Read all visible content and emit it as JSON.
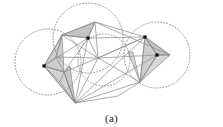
{
  "figure": {
    "caption": "(a)",
    "title": "",
    "background_color": "#ffffff"
  },
  "chart_data": {
    "type": "scatter",
    "title": "",
    "subtitle": "",
    "xlabel": "",
    "ylabel": "",
    "xlim": [
      0,
      223
    ],
    "ylim": [
      0,
      127
    ],
    "grid": false,
    "legend": null,
    "annotations": [
      "(a)"
    ],
    "styles": {
      "edge_color": "#8a8a8a",
      "edge_width": 0.7,
      "dotted_circle_color": "#777777",
      "dotted_circle_width": 0.8,
      "dotted_dash": "1,2",
      "vertex_color": "#111111",
      "vertex_size": 3.2,
      "shaded_face_fill": "#b8b8b8",
      "shaded_face_opacity": 0.75,
      "shaded_face_fill_light": "#cfcfcf"
    },
    "marked_vertices": [
      {
        "id": "v-left",
        "x": 44,
        "y": 66
      },
      {
        "id": "v-top",
        "x": 88,
        "y": 38
      },
      {
        "id": "v-right",
        "x": 157,
        "y": 55
      },
      {
        "id": "v-apex",
        "x": 145,
        "y": 37
      }
    ],
    "nodes": [
      {
        "id": "A",
        "x": 44,
        "y": 66
      },
      {
        "id": "B",
        "x": 62,
        "y": 35
      },
      {
        "id": "C",
        "x": 95,
        "y": 22
      },
      {
        "id": "D",
        "x": 88,
        "y": 38
      },
      {
        "id": "E",
        "x": 145,
        "y": 37
      },
      {
        "id": "F",
        "x": 157,
        "y": 55
      },
      {
        "id": "G",
        "x": 170,
        "y": 55
      },
      {
        "id": "H",
        "x": 140,
        "y": 82
      },
      {
        "id": "I",
        "x": 75,
        "y": 103
      },
      {
        "id": "J",
        "x": 56,
        "y": 57
      },
      {
        "id": "K",
        "x": 64,
        "y": 72
      },
      {
        "id": "L",
        "x": 98,
        "y": 58
      },
      {
        "id": "M",
        "x": 118,
        "y": 96
      },
      {
        "id": "N",
        "x": 60,
        "y": 82
      }
    ],
    "edges": [
      [
        "A",
        "B"
      ],
      [
        "B",
        "C"
      ],
      [
        "C",
        "E"
      ],
      [
        "E",
        "G"
      ],
      [
        "G",
        "F"
      ],
      [
        "E",
        "F"
      ],
      [
        "F",
        "H"
      ],
      [
        "E",
        "H"
      ],
      [
        "H",
        "I"
      ],
      [
        "I",
        "A"
      ],
      [
        "A",
        "D"
      ],
      [
        "B",
        "D"
      ],
      [
        "C",
        "D"
      ],
      [
        "D",
        "E"
      ],
      [
        "D",
        "I"
      ],
      [
        "D",
        "L"
      ],
      [
        "L",
        "E"
      ],
      [
        "L",
        "I"
      ],
      [
        "A",
        "J"
      ],
      [
        "J",
        "K"
      ],
      [
        "K",
        "I"
      ],
      [
        "J",
        "B"
      ],
      [
        "K",
        "D"
      ],
      [
        "A",
        "K"
      ],
      [
        "B",
        "J"
      ],
      [
        "C",
        "L"
      ],
      [
        "I",
        "M"
      ],
      [
        "M",
        "H"
      ],
      [
        "E",
        "I"
      ],
      [
        "F",
        "I"
      ],
      [
        "E",
        "L"
      ],
      [
        "H",
        "L"
      ],
      [
        "A",
        "N"
      ],
      [
        "N",
        "I"
      ],
      [
        "N",
        "K"
      ],
      [
        "J",
        "L"
      ],
      [
        "K",
        "L"
      ],
      [
        "C",
        "G"
      ],
      [
        "B",
        "L"
      ],
      [
        "F",
        "L"
      ]
    ],
    "shaded_faces": [
      {
        "id": "face-top",
        "points": [
          [
            62,
            35
          ],
          [
            95,
            22
          ],
          [
            88,
            38
          ]
        ],
        "fill": "#b0b0b0"
      },
      {
        "id": "face-left-upper",
        "points": [
          [
            44,
            66
          ],
          [
            62,
            35
          ],
          [
            64,
            72
          ]
        ],
        "fill": "#bdbdbd"
      },
      {
        "id": "face-left-lower",
        "points": [
          [
            44,
            66
          ],
          [
            64,
            72
          ],
          [
            75,
            103
          ]
        ],
        "fill": "#c4c4c4"
      },
      {
        "id": "face-left-sliver",
        "points": [
          [
            64,
            72
          ],
          [
            70,
            66
          ],
          [
            75,
            103
          ]
        ],
        "fill": "#b5b5b5"
      },
      {
        "id": "face-right-upper",
        "points": [
          [
            145,
            37
          ],
          [
            170,
            55
          ],
          [
            157,
            55
          ]
        ],
        "fill": "#b0b0b0"
      },
      {
        "id": "face-right-lower",
        "points": [
          [
            145,
            37
          ],
          [
            157,
            55
          ],
          [
            140,
            82
          ]
        ],
        "fill": "#bcbcbc"
      },
      {
        "id": "face-right-tip",
        "points": [
          [
            157,
            55
          ],
          [
            170,
            55
          ],
          [
            140,
            82
          ]
        ],
        "fill": "#c9c9c9"
      },
      {
        "id": "face-bottom-sliver",
        "points": [
          [
            128,
            52
          ],
          [
            140,
            82
          ],
          [
            133,
            52
          ]
        ],
        "fill": "#c8c8c8"
      }
    ],
    "circles": [
      {
        "id": "circle-left",
        "cx": 48,
        "cy": 62,
        "r": 33
      },
      {
        "id": "circle-top",
        "cx": 88,
        "cy": 38,
        "r": 35
      },
      {
        "id": "circle-right",
        "cx": 157,
        "cy": 55,
        "r": 33
      },
      {
        "id": "circle-inner",
        "cx": 104,
        "cy": 60,
        "r": 26
      }
    ]
  }
}
